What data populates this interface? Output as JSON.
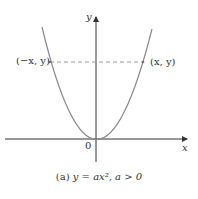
{
  "figure": {
    "axis_labels": {
      "x": "x",
      "y": "y",
      "origin": "0"
    },
    "points": {
      "left": "(−x, y)",
      "right": "(x, y)"
    },
    "caption": {
      "tag": "(a)",
      "equation": "y = ax², a > 0"
    },
    "colors": {
      "curve": "#8a8a8a",
      "axis": "#333333",
      "dash": "#9a9a9a"
    }
  }
}
